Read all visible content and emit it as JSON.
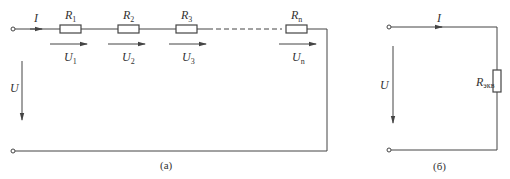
{
  "colors": {
    "wire": "#444444",
    "text": "#333333",
    "background": "#ffffff"
  },
  "diagram_a": {
    "caption": "(a)",
    "current_label": "I",
    "voltage_label": "U",
    "resistors": [
      {
        "name": "R",
        "sub": "1",
        "voltage": "U",
        "vsub": "1"
      },
      {
        "name": "R",
        "sub": "2",
        "voltage": "U",
        "vsub": "2"
      },
      {
        "name": "R",
        "sub": "3",
        "voltage": "U",
        "vsub": "3"
      },
      {
        "name": "R",
        "sub": "n",
        "voltage": "U",
        "vsub": "n"
      }
    ]
  },
  "diagram_b": {
    "caption": "(б)",
    "current_label": "I",
    "voltage_label": "U",
    "resistor": {
      "name": "R",
      "sub": "экв"
    }
  }
}
